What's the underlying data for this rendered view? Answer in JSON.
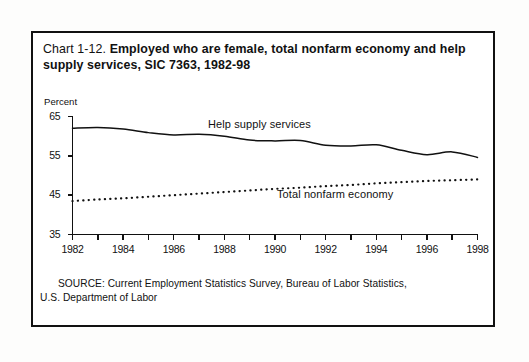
{
  "chart_data": {
    "type": "line",
    "title": "Chart 1-12. Employed who are female, total nonfarm economy and help supply services, SIC 7363, 1982-98",
    "title_prefix": "Chart 1-12.",
    "title_bold": "Employed who are female, total nonfarm economy and help supply services, SIC 7363, 1982-98",
    "ylabel": "Percent",
    "xlabel": "",
    "ylim": [
      35,
      65
    ],
    "xlim": [
      1982,
      1998
    ],
    "ytick_labels": [
      "65",
      "55",
      "45",
      "35"
    ],
    "yticks": [
      65,
      55,
      45,
      35
    ],
    "xtick_labels": [
      "1982",
      "1984",
      "1986",
      "1988",
      "1990",
      "1992",
      "1994",
      "1996",
      "1998"
    ],
    "xticks": [
      1982,
      1984,
      1986,
      1988,
      1990,
      1992,
      1994,
      1996,
      1998
    ],
    "grid": false,
    "legend_position": "inline-annotations",
    "x": [
      1982,
      1983,
      1984,
      1985,
      1986,
      1987,
      1988,
      1989,
      1990,
      1991,
      1992,
      1993,
      1994,
      1995,
      1996,
      1997,
      1998
    ],
    "series": [
      {
        "name": "Help supply services",
        "style": "solid",
        "color": "#111111",
        "values": [
          62.0,
          62.2,
          61.8,
          60.9,
          60.3,
          60.5,
          60.0,
          59.0,
          58.8,
          58.9,
          57.7,
          57.5,
          57.8,
          56.4,
          55.3,
          56.0,
          54.6
        ]
      },
      {
        "name": "Total nonfarm economy",
        "style": "dotted",
        "color": "#111111",
        "values": [
          43.5,
          43.9,
          44.2,
          44.6,
          45.0,
          45.4,
          45.8,
          46.2,
          46.6,
          46.9,
          47.3,
          47.6,
          48.0,
          48.3,
          48.6,
          48.8,
          49.0
        ]
      }
    ],
    "annotations": [
      {
        "text": "Help supply services",
        "x": 1989.2,
        "y": 62.6
      },
      {
        "text": "Total nonfarm economy",
        "x": 1992.0,
        "y": 45.5
      }
    ]
  },
  "source": {
    "line1": "SOURCE: Current Employment Statistics Survey, Bureau of Labor Statistics,",
    "line2": "U.S. Department of Labor"
  }
}
